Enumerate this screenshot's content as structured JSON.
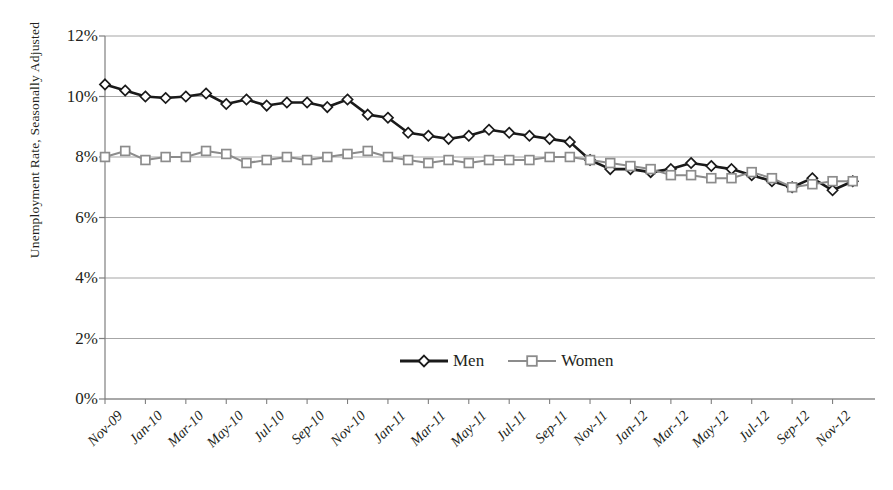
{
  "chart_data": {
    "type": "line",
    "title": "",
    "xlabel": "",
    "ylabel": "Unemployment Rate, Seasonally Adjusted",
    "ylim": [
      0,
      12
    ],
    "ytick_labels": [
      "12%",
      "10%",
      "8%",
      "6%",
      "4%",
      "2%",
      "0%"
    ],
    "ytick_values": [
      12,
      10,
      8,
      6,
      4,
      2,
      0
    ],
    "grid": true,
    "legend_position": "bottom-center",
    "x": [
      "Nov-09",
      "Dec-09",
      "Jan-10",
      "Feb-10",
      "Mar-10",
      "Apr-10",
      "May-10",
      "Jun-10",
      "Jul-10",
      "Aug-10",
      "Sep-10",
      "Oct-10",
      "Nov-10",
      "Dec-10",
      "Jan-11",
      "Feb-11",
      "Mar-11",
      "Apr-11",
      "May-11",
      "Jun-11",
      "Jul-11",
      "Aug-11",
      "Sep-11",
      "Oct-11",
      "Nov-11",
      "Dec-11",
      "Jan-12",
      "Feb-12",
      "Mar-12",
      "Apr-12",
      "May-12",
      "Jun-12",
      "Jul-12",
      "Aug-12",
      "Sep-12",
      "Oct-12",
      "Nov-12",
      "Dec-12"
    ],
    "xtick_labels": [
      "Nov-09",
      "Jan-10",
      "Mar-10",
      "May-10",
      "Jul-10",
      "Sep-10",
      "Nov-10",
      "Jan-11",
      "Mar-11",
      "May-11",
      "Jul-11",
      "Sep-11",
      "Nov-11",
      "Jan-12",
      "Mar-12",
      "May-12",
      "Jul-12",
      "Sep-12",
      "Nov-12"
    ],
    "xtick_indices": [
      0,
      2,
      4,
      6,
      8,
      10,
      12,
      14,
      16,
      18,
      20,
      22,
      24,
      26,
      28,
      30,
      32,
      34,
      36
    ],
    "series": [
      {
        "name": "Men",
        "color": "#1a1a1a",
        "marker": "diamond",
        "values": [
          10.4,
          10.2,
          10.0,
          9.95,
          10.0,
          10.1,
          9.75,
          9.9,
          9.7,
          9.8,
          9.8,
          9.65,
          9.9,
          9.4,
          9.3,
          8.8,
          8.7,
          8.6,
          8.7,
          8.9,
          8.8,
          8.7,
          8.6,
          8.5,
          7.9,
          7.6,
          7.6,
          7.5,
          7.6,
          7.8,
          7.7,
          7.6,
          7.4,
          7.2,
          7.0,
          7.3,
          6.9,
          7.2
        ]
      },
      {
        "name": "Women",
        "color": "#8c8c8c",
        "marker": "square",
        "values": [
          8.0,
          8.2,
          7.9,
          8.0,
          8.0,
          8.2,
          8.1,
          7.8,
          7.9,
          8.0,
          7.9,
          8.0,
          8.1,
          8.2,
          8.0,
          7.9,
          7.8,
          7.9,
          7.8,
          7.9,
          7.9,
          7.9,
          8.0,
          8.0,
          7.9,
          7.8,
          7.7,
          7.6,
          7.4,
          7.4,
          7.3,
          7.3,
          7.5,
          7.3,
          7.0,
          7.1,
          7.2,
          7.2
        ]
      }
    ]
  },
  "legend": {
    "entries": [
      {
        "label": "Men",
        "marker": "diamond-marker-icon"
      },
      {
        "label": "Women",
        "marker": "square-marker-icon"
      }
    ]
  },
  "axes": {
    "y_title": "Unemployment Rate, Seasonally Adjusted"
  },
  "colors": {
    "men_line": "#1a1a1a",
    "women_line": "#8c8c8c",
    "gridline": "#a6a6a6",
    "axis": "#7f7f7f",
    "marker_fill": "#ffffff",
    "text": "#231f20",
    "background": "#ffffff"
  }
}
